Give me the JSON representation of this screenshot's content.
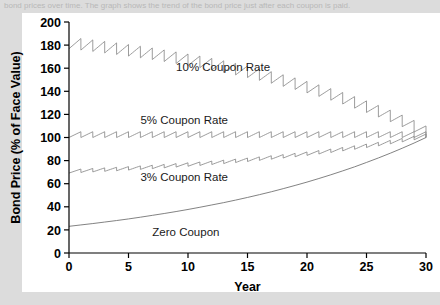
{
  "caption": {
    "text": "bond prices over time. The graph shows the trend of the bond price just after each coupon is paid."
  },
  "chart_data": {
    "type": "line",
    "title": "",
    "xlabel": "Year",
    "ylabel": "Bond Price (% of Face Value)",
    "xlim": [
      0,
      30
    ],
    "ylim": [
      0,
      200
    ],
    "xticks": [
      0,
      5,
      10,
      15,
      20,
      25,
      30
    ],
    "yticks": [
      0,
      20,
      40,
      60,
      80,
      100,
      120,
      140,
      160,
      180,
      200
    ],
    "grid": false,
    "legend_position": "inline-annotations",
    "yield_to_maturity_pct": 5,
    "face_value_pct": 100,
    "maturity_years": 30,
    "series": [
      {
        "name": "10% Coupon Rate",
        "coupon_rate_pct": 10,
        "label": "10% Coupon Rate",
        "label_x": 9.0,
        "label_y": 158,
        "color": "#8a8a8a",
        "sawtooth": true,
        "x": [
          0,
          1,
          2,
          3,
          4,
          5,
          6,
          7,
          8,
          9,
          10,
          11,
          12,
          13,
          14,
          15,
          16,
          17,
          18,
          19,
          20,
          21,
          22,
          23,
          24,
          25,
          26,
          27,
          28,
          29,
          30
        ],
        "values": [
          176.9,
          175.7,
          174.5,
          173.2,
          171.9,
          170.5,
          169.0,
          167.5,
          165.8,
          164.1,
          162.3,
          160.5,
          158.5,
          156.4,
          154.2,
          151.9,
          149.5,
          147.0,
          144.3,
          141.6,
          138.6,
          135.6,
          132.3,
          129.0,
          125.4,
          121.7,
          117.8,
          113.7,
          109.4,
          104.8,
          100.0
        ]
      },
      {
        "name": "5% Coupon Rate",
        "coupon_rate_pct": 5,
        "label": "5% Coupon Rate",
        "label_x": 6.0,
        "label_y": 112,
        "color": "#8a8a8a",
        "sawtooth": true,
        "x": [
          0,
          1,
          2,
          3,
          4,
          5,
          6,
          7,
          8,
          9,
          10,
          11,
          12,
          13,
          14,
          15,
          16,
          17,
          18,
          19,
          20,
          21,
          22,
          23,
          24,
          25,
          26,
          27,
          28,
          29,
          30
        ],
        "values": [
          100,
          100,
          100,
          100,
          100,
          100,
          100,
          100,
          100,
          100,
          100,
          100,
          100,
          100,
          100,
          100,
          100,
          100,
          100,
          100,
          100,
          100,
          100,
          100,
          100,
          100,
          100,
          100,
          100,
          100,
          100
        ]
      },
      {
        "name": "3% Coupon Rate",
        "coupon_rate_pct": 3,
        "label": "3% Coupon Rate",
        "label_x": 6.0,
        "label_y": 62,
        "color": "#8a8a8a",
        "sawtooth": true,
        "x": [
          0,
          1,
          2,
          3,
          4,
          5,
          6,
          7,
          8,
          9,
          10,
          11,
          12,
          13,
          14,
          15,
          16,
          17,
          18,
          19,
          20,
          21,
          22,
          23,
          24,
          25,
          26,
          27,
          28,
          29,
          30
        ],
        "values": [
          69.2,
          69.7,
          70.2,
          70.7,
          71.2,
          71.8,
          72.4,
          73.0,
          73.7,
          74.4,
          75.1,
          75.8,
          76.6,
          77.4,
          78.3,
          79.2,
          80.2,
          81.2,
          82.2,
          83.3,
          84.5,
          85.7,
          87.0,
          88.4,
          89.8,
          91.3,
          92.8,
          94.5,
          96.2,
          98.0,
          100.0
        ]
      },
      {
        "name": "Zero Coupon",
        "coupon_rate_pct": 0,
        "label": "Zero Coupon",
        "label_x": 7.0,
        "label_y": 15,
        "color": "#6b6b6b",
        "sawtooth": false,
        "x": [
          0,
          1,
          2,
          3,
          4,
          5,
          6,
          7,
          8,
          9,
          10,
          11,
          12,
          13,
          14,
          15,
          16,
          17,
          18,
          19,
          20,
          21,
          22,
          23,
          24,
          25,
          26,
          27,
          28,
          29,
          30
        ],
        "values": [
          23.1,
          24.3,
          25.5,
          26.8,
          28.1,
          29.5,
          31.0,
          32.6,
          34.2,
          35.9,
          37.7,
          39.6,
          41.6,
          43.6,
          45.8,
          48.1,
          50.5,
          53.0,
          55.7,
          58.5,
          61.4,
          64.5,
          67.7,
          71.1,
          74.6,
          78.4,
          82.3,
          86.4,
          90.7,
          95.2,
          100.0
        ]
      }
    ]
  }
}
